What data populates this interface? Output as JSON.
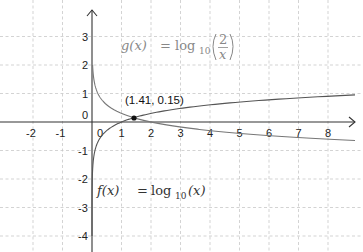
{
  "chart_data": {
    "type": "line",
    "title": "",
    "xlabel": "",
    "ylabel": "",
    "xlim": [
      -3,
      9.1
    ],
    "ylim": [
      -4.2,
      3.9
    ],
    "grid": true,
    "x_ticks": [
      "-2",
      "-1",
      "0",
      "1",
      "2",
      "3",
      "4",
      "5",
      "6",
      "7",
      "8"
    ],
    "y_ticks": [
      "3",
      "2",
      "1",
      "0",
      "-1",
      "-2",
      "-3",
      "-4"
    ],
    "series": [
      {
        "name": "f(x) = log10(x)",
        "function": "log10(x)",
        "x": [
          0.01,
          0.05,
          0.1,
          0.25,
          0.5,
          1,
          1.41,
          2,
          3,
          4,
          5,
          6,
          7,
          8,
          9
        ],
        "values": [
          -2,
          -1.3,
          -1,
          -0.6,
          -0.3,
          0,
          0.15,
          0.3,
          0.48,
          0.6,
          0.7,
          0.78,
          0.85,
          0.9,
          0.95
        ]
      },
      {
        "name": "g(x) = log10(2/x)",
        "function": "log10(2/x)",
        "x": [
          0.02,
          0.05,
          0.1,
          0.25,
          0.5,
          1,
          1.41,
          2,
          3,
          4,
          5,
          6,
          7,
          8,
          9
        ],
        "values": [
          2,
          1.6,
          1.3,
          0.9,
          0.6,
          0.3,
          0.15,
          0,
          -0.18,
          -0.3,
          -0.4,
          -0.48,
          -0.54,
          -0.6,
          -0.65
        ]
      }
    ],
    "annotations": [
      {
        "text": "(1.41, 0.15)",
        "x": 1.41,
        "y": 0.15,
        "type": "intersection-point"
      }
    ]
  },
  "labels": {
    "f_name": "f(x)",
    "f_eq": "=",
    "f_rhs_log": "log",
    "f_rhs_base": "10",
    "f_rhs_arg": "(x)",
    "g_name": "g(x)",
    "g_eq": "=",
    "g_rhs_log": "log",
    "g_rhs_base": "10",
    "g_num": "2",
    "g_den": "x",
    "intersection": "(1.41, 0.15)"
  }
}
